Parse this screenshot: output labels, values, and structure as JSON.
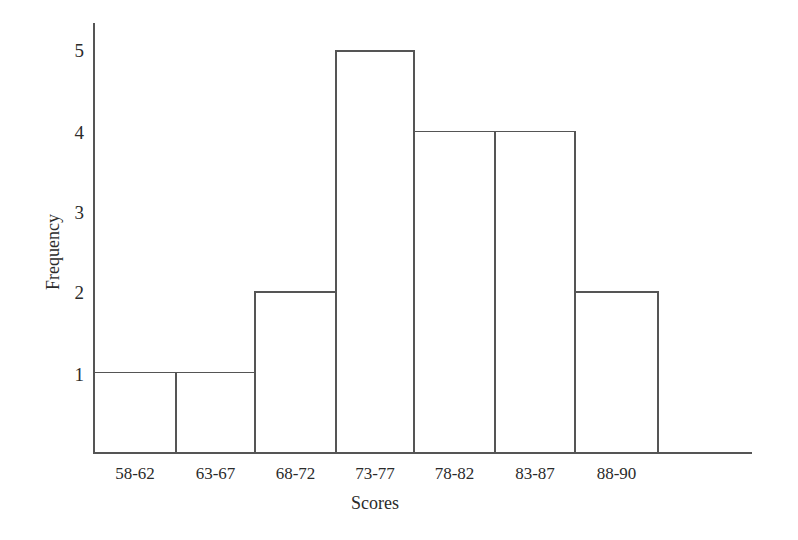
{
  "chart_data": {
    "type": "bar",
    "title": "",
    "subtitle": "",
    "xlabel": "Scores",
    "ylabel": "Frequency",
    "categories": [
      "58-62",
      "63-67",
      "68-72",
      "73-77",
      "78-82",
      "83-87",
      "88-90"
    ],
    "values": [
      1,
      1,
      2,
      5,
      4,
      4,
      2
    ],
    "series": [
      {
        "name": "Frequency",
        "values": [
          1,
          1,
          2,
          5,
          4,
          4,
          2
        ]
      }
    ],
    "ytick_labels": [
      "5",
      "4",
      "3",
      "2",
      "1"
    ],
    "ytick_values": [
      5,
      4,
      3,
      2,
      1
    ],
    "ylim": [
      0,
      5.35
    ],
    "xlim_categories": 7,
    "grid": false,
    "legend": false,
    "legend_position": "none",
    "bars_contiguous": true,
    "bar_fill_color": "#ffffff",
    "bar_stroke_color": "#555555",
    "axis_color": "#555555",
    "background_color": "#ffffff",
    "text_color": "#2b2b2b"
  },
  "geometry": {
    "axis_x": 94,
    "axis_top_y": 23,
    "baseline_y": 453,
    "baseline_right_x": 752,
    "bar_edges": [
      94,
      176,
      255,
      336,
      414,
      495,
      575,
      658
    ],
    "unit_height_px": 80.4,
    "ytick_y": [
      51,
      133,
      213,
      293,
      375
    ]
  }
}
